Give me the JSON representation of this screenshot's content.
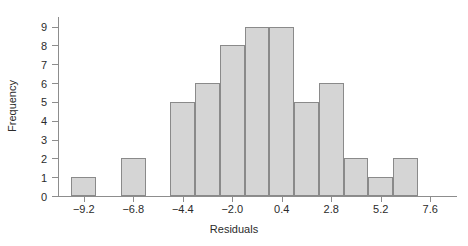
{
  "chart_data": {
    "type": "bar",
    "title": "",
    "subtitle": "",
    "xlabel": "Residuals",
    "ylabel": "Frequency",
    "grid": false,
    "legend": false,
    "legend_position": "none",
    "bin_width": 1.2,
    "bin_edges": [
      -9.8,
      -8.6,
      -7.4,
      -6.2,
      -5.0,
      -3.8,
      -2.6,
      -1.4,
      -0.2,
      1.0,
      2.2,
      3.4,
      4.6,
      5.8,
      7.0
    ],
    "bin_centers": [
      -9.2,
      -8.0,
      -6.8,
      -5.6,
      -4.4,
      -3.2,
      -2.0,
      -0.8,
      0.4,
      1.6,
      2.8,
      4.0,
      5.2,
      6.4
    ],
    "categories": [
      "-9.2",
      "-8.0",
      "-6.8",
      "-5.6",
      "-4.4",
      "-3.2",
      "-2.0",
      "-0.8",
      "0.4",
      "1.6",
      "2.8",
      "4.0",
      "5.2",
      "6.4"
    ],
    "values": [
      1,
      0,
      2,
      0,
      5,
      6,
      8,
      9,
      9,
      5,
      6,
      2,
      1,
      2
    ],
    "bars": [
      {
        "left": -9.8,
        "right": -8.6,
        "frequency": 1
      },
      {
        "left": -8.6,
        "right": -7.4,
        "frequency": 0
      },
      {
        "left": -7.4,
        "right": -6.2,
        "frequency": 2
      },
      {
        "left": -6.2,
        "right": -5.0,
        "frequency": 0
      },
      {
        "left": -5.0,
        "right": -3.8,
        "frequency": 5
      },
      {
        "left": -3.8,
        "right": -2.6,
        "frequency": 6
      },
      {
        "left": -2.6,
        "right": -1.4,
        "frequency": 8
      },
      {
        "left": -1.4,
        "right": -0.2,
        "frequency": 9
      },
      {
        "left": -0.2,
        "right": 1.0,
        "frequency": 9
      },
      {
        "left": 1.0,
        "right": 2.2,
        "frequency": 5
      },
      {
        "left": 2.2,
        "right": 3.4,
        "frequency": 6
      },
      {
        "left": 3.4,
        "right": 4.6,
        "frequency": 2
      },
      {
        "left": 4.6,
        "right": 5.8,
        "frequency": 1
      },
      {
        "left": 5.8,
        "right": 7.0,
        "frequency": 2
      }
    ],
    "xlim": [
      -10.4,
      8.8
    ],
    "ylim": [
      0,
      9.4
    ],
    "xticks": [
      -9.2,
      -6.8,
      -4.4,
      -2.0,
      0.4,
      2.8,
      5.2,
      7.6
    ],
    "xtick_labels": [
      "−9.2",
      "−6.8",
      "−4.4",
      "−2.0",
      "0.4",
      "2.8",
      "5.2",
      "7.6"
    ],
    "yticks": [
      0,
      1,
      2,
      3,
      4,
      5,
      6,
      7,
      8,
      9
    ],
    "ytick_labels": [
      "0",
      "1",
      "2",
      "3",
      "4",
      "5",
      "6",
      "7",
      "8",
      "9"
    ],
    "total_count": 56,
    "colors": {
      "bar_fill": "#d5d5d5",
      "bar_edge": "#8a8a8a",
      "axis": "#8d8d8d",
      "text": "#2b2b2b",
      "background": "#ffffff"
    }
  }
}
